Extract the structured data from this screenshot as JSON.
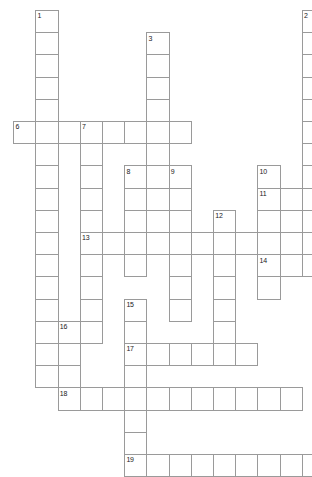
{
  "puzzle": {
    "title": "Crossword Grid",
    "width_px": 312,
    "height_px": 477,
    "cell_size_px": 22.2,
    "origin_x_px": 13.2,
    "origin_y_px": 10,
    "cell_fill_color": "#ffffff",
    "cell_border_color": "#9a9a9a",
    "number_color": "#1a1a1a",
    "background_color": "#ffffff",
    "columns": 14,
    "rows": 21,
    "entry_count": 19,
    "across_count": 7,
    "down_count": 9
  },
  "entries": [
    {
      "number": "1",
      "direction": "down",
      "col": 1,
      "row": 0,
      "length": 17
    },
    {
      "number": "2",
      "direction": "down",
      "col": 13,
      "row": 0,
      "length": 11
    },
    {
      "number": "3",
      "direction": "down",
      "col": 6,
      "row": 1,
      "length": 9
    },
    {
      "number": "6",
      "direction": "across",
      "col": 0,
      "row": 5,
      "length": 8
    },
    {
      "number": "7",
      "direction": "down",
      "col": 3,
      "row": 5,
      "length": 10
    },
    {
      "number": "8",
      "direction": "down",
      "col": 5,
      "row": 7,
      "length": 5
    },
    {
      "number": "9",
      "direction": "down",
      "col": 7,
      "row": 7,
      "length": 7
    },
    {
      "number": "10",
      "direction": "down",
      "col": 11,
      "row": 7,
      "length": 6
    },
    {
      "number": "11",
      "direction": "across",
      "col": 11,
      "row": 8,
      "length": 3
    },
    {
      "number": "12",
      "direction": "down",
      "col": 9,
      "row": 9,
      "length": 6
    },
    {
      "number": "13",
      "direction": "across",
      "col": 3,
      "row": 10,
      "length": 10
    },
    {
      "number": "14",
      "direction": "across",
      "col": 11,
      "row": 11,
      "length": 3
    },
    {
      "number": "15",
      "direction": "down",
      "col": 5,
      "row": 13,
      "length": 8
    },
    {
      "number": "16",
      "direction": "down",
      "col": 2,
      "row": 14,
      "length": 4
    },
    {
      "number": "17",
      "direction": "across",
      "col": 5,
      "row": 15,
      "length": 6
    },
    {
      "number": "18",
      "direction": "across",
      "col": 2,
      "row": 17,
      "length": 11
    },
    {
      "number": "19",
      "direction": "across",
      "col": 5,
      "row": 20,
      "length": 9
    }
  ],
  "numbers_visible": [
    "1",
    "2",
    "3",
    "6",
    "7",
    "8",
    "9",
    "10",
    "11",
    "12",
    "13",
    "14",
    "15",
    "16",
    "17",
    "18",
    "19"
  ]
}
